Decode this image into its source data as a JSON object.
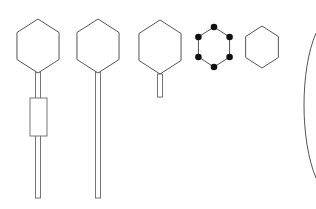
{
  "diagram": {
    "colors": {
      "background": "#ffffff",
      "stroke": "#555555",
      "dot": "#111111"
    },
    "shapes": [
      {
        "id": "hexagon-long-stem-with-box",
        "center": [
          38,
          46
        ],
        "radius": 27,
        "stem": {
          "top": 72,
          "bottom": 198,
          "width": 5
        },
        "box": {
          "x": 30,
          "y": 98,
          "w": 17,
          "h": 38
        }
      },
      {
        "id": "hexagon-long-stem",
        "center": [
          98,
          46
        ],
        "radius": 27,
        "stem": {
          "top": 72,
          "bottom": 198,
          "width": 5
        }
      },
      {
        "id": "hexagon-short-stem",
        "center": [
          160,
          47
        ],
        "radius": 27,
        "stem": {
          "top": 74,
          "bottom": 97,
          "width": 5
        }
      },
      {
        "id": "hexagon-dotted-vertices",
        "center": [
          214,
          47
        ],
        "radius": 20,
        "dots": 6
      },
      {
        "id": "hexagon-plain",
        "center": [
          262,
          47
        ],
        "radius": 21
      },
      {
        "id": "curve-line",
        "path": "M316 33 C 300 70, 300 140, 316 178"
      }
    ]
  }
}
